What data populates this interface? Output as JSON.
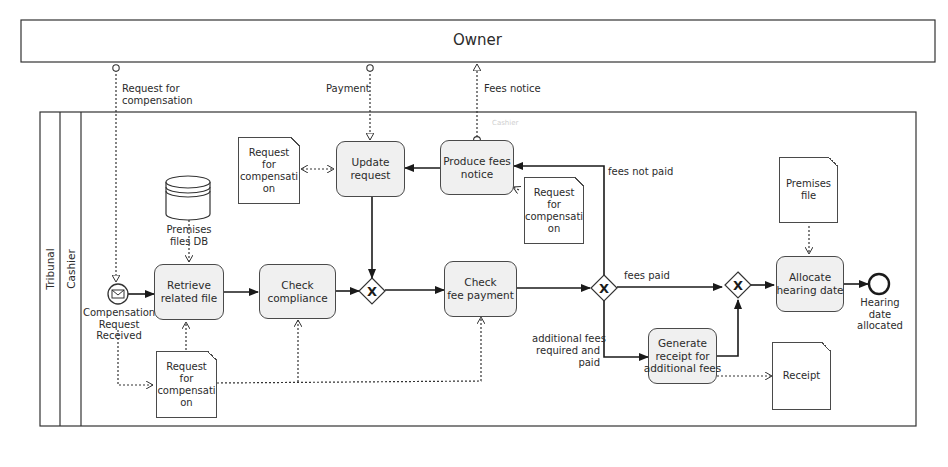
{
  "pools": {
    "owner": {
      "label": "Owner"
    },
    "tribunal": {
      "label": "Tribunal",
      "lane": "Cashier",
      "lane_faint_label": "Cashier"
    }
  },
  "message_flows": {
    "request_for_compensation": "Request for\ncompensation",
    "payment": "Payment",
    "fees_notice": "Fees notice"
  },
  "events": {
    "start": {
      "label": "Compensation\nRequest\nReceived",
      "type": "message-start"
    },
    "end": {
      "label": "Hearing\ndate\nallocated",
      "type": "end"
    }
  },
  "tasks": {
    "retrieve": "Retrieve\nrelated file",
    "compliance": "Check\ncompliance",
    "update": "Update\nrequest",
    "produce": "Produce fees\nnotice",
    "check_fee": "Check\nfee payment",
    "receipt": "Generate\nreceipt for\nadditional fees",
    "allocate": "Allocate\nhearing date"
  },
  "data_objects": {
    "db": "Premises\nfiles DB",
    "req_top": "Request\nfor\ncompensati\non",
    "req_mid": "Request\nfor\ncompensati\non",
    "req_bottom": "Request\nfor\ncompensati\non",
    "premises_file": "Premises file",
    "receipt_doc": "Receipt"
  },
  "sequence_flow_labels": {
    "fees_not_paid": "fees not paid",
    "fees_paid": "fees paid",
    "additional": "additional fees\nrequired and\npaid"
  },
  "gateways": {
    "g1": "X",
    "g2": "X",
    "g3": "X"
  }
}
